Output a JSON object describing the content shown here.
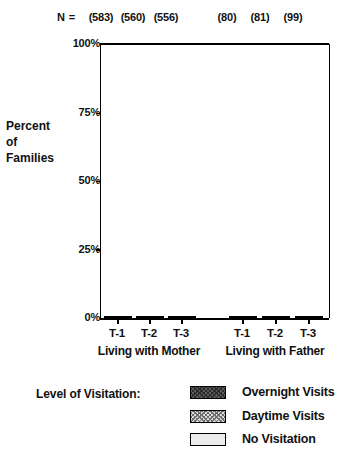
{
  "chart_data": {
    "type": "bar",
    "subtype": "stacked-vertical-100pct",
    "title": "",
    "xlabel": "",
    "ylabel": "Percent of Families",
    "ylim": [
      0,
      100
    ],
    "ytick_labels": [
      "0%",
      "25%",
      "50%",
      "75%",
      "100%"
    ],
    "ytick_values": [
      0,
      25,
      50,
      75,
      100
    ],
    "grid": false,
    "legend_position": "below",
    "legend_title": "Level of Visitation:",
    "categories": [
      "T-1",
      "T-2",
      "T-3",
      "T-1",
      "T-2",
      "T-3"
    ],
    "groups": [
      {
        "label": "Living with Mother",
        "categories": [
          "T-1",
          "T-2",
          "T-3"
        ]
      },
      {
        "label": "Living with Father",
        "categories": [
          "T-1",
          "T-2",
          "T-3"
        ]
      }
    ],
    "n_prefix": "N =",
    "n_values": [
      "(583)",
      "(560)",
      "(556)",
      "(80)",
      "(81)",
      "(99)"
    ],
    "series": [
      {
        "name": "Overnight Visits",
        "fill": "dark-checker",
        "values": [
          48.5,
          48.5,
          44.0,
          48.0,
          48.5,
          48.5
        ]
      },
      {
        "name": "Daytime Visits",
        "fill": "light-checker",
        "values": [
          30.5,
          22.5,
          19.5,
          23.5,
          33.5,
          38.5
        ]
      },
      {
        "name": "No Visitation",
        "fill": "solid-pale",
        "values": [
          21.0,
          29.0,
          36.5,
          28.5,
          18.0,
          13.0
        ]
      }
    ],
    "colors": {
      "overnight": "#5d5d5d",
      "daytime": "#d9d9d9",
      "no_visitation": "#ececec",
      "axis": "#000000"
    }
  }
}
